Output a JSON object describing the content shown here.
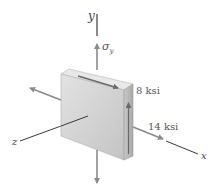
{
  "diagram": {
    "axes": {
      "x_label": "x",
      "y_label": "y",
      "z_label": "z"
    },
    "labels": {
      "sigma_y_symbol": "σ",
      "sigma_y_subscript": "y",
      "shear_stress": "8 ksi",
      "normal_stress_x": "14 ksi"
    },
    "colors": {
      "axis_line": "#3a3a3a",
      "stress_arrow": "#8a8a8a",
      "block_front": "#d4d4d4",
      "block_top": "#e6e6e6",
      "block_side": "#bdbdbd",
      "label_text": "#555555"
    }
  }
}
